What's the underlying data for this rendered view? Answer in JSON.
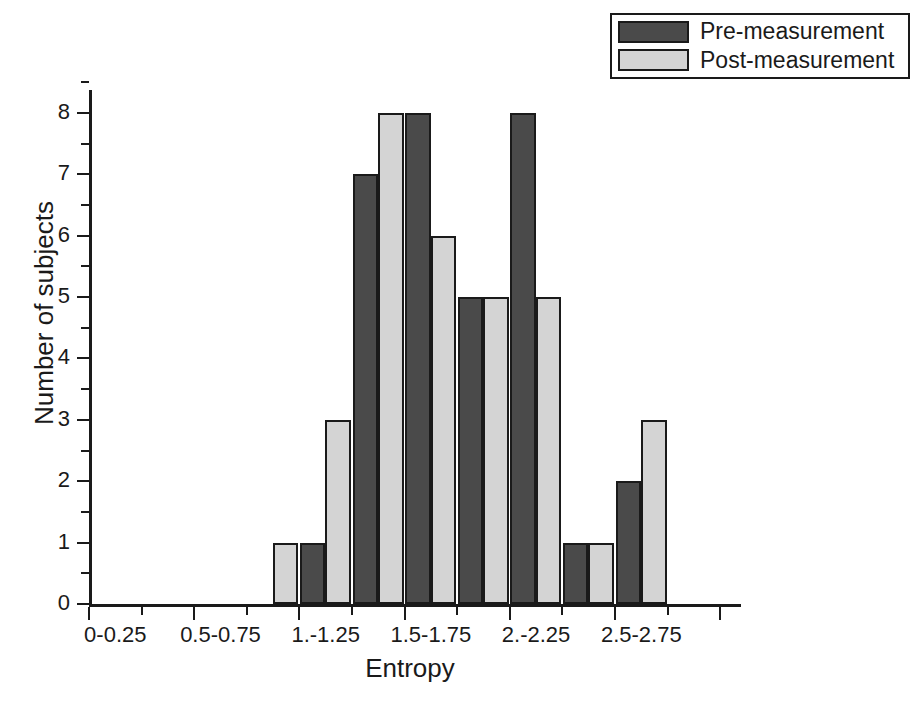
{
  "chart_data": {
    "type": "bar",
    "title": "",
    "subtitle": "",
    "xlabel": "Entropy",
    "ylabel": "Number of subjects",
    "ylim": [
      0,
      8.6
    ],
    "ytick_values": [
      0,
      1,
      2,
      3,
      4,
      5,
      6,
      7,
      8
    ],
    "ytick_labels": [
      "0",
      "1",
      "2",
      "3",
      "4",
      "5",
      "6",
      "7",
      "8"
    ],
    "y_minor_ticks": true,
    "grid": false,
    "legend_position": "top-right",
    "bin_edges": [
      0,
      0.25,
      0.5,
      0.75,
      1.0,
      1.25,
      1.5,
      1.75,
      2.0,
      2.25,
      2.5,
      2.75,
      3.0
    ],
    "categories": [
      "0-0.25",
      "0.25-0.5",
      "0.5-0.75",
      "0.75-1.",
      "1.-1.25",
      "1.25-1.5",
      "1.5-1.75",
      "1.75-2.",
      "2.-2.25",
      "2.25-2.5",
      "2.5-2.75",
      "2.75-3."
    ],
    "xtick_labels_shown": [
      "0-0.25",
      "0.5-0.75",
      "1.-1.25",
      "1.5-1.75",
      "2.-2.25",
      "2.5-2.75"
    ],
    "xtick_label_bin_index": [
      0,
      2,
      4,
      6,
      8,
      10
    ],
    "series": [
      {
        "name": "Pre-measurement",
        "color": "#4a4a4a",
        "values": [
          0,
          0,
          0,
          0,
          1,
          7,
          8,
          5,
          8,
          1,
          2,
          0
        ]
      },
      {
        "name": "Post-measurement",
        "color": "#d4d4d4",
        "values": [
          0,
          0,
          0,
          1,
          3,
          8,
          6,
          5,
          5,
          1,
          3,
          0
        ]
      }
    ]
  },
  "legend": {
    "items": [
      {
        "label": "Pre-measurement",
        "swatch_name": "legend-swatch-pre"
      },
      {
        "label": "Post-measurement",
        "swatch_name": "legend-swatch-post"
      }
    ]
  },
  "axes": {
    "x_title": "Entropy",
    "y_title": "Number of subjects"
  }
}
